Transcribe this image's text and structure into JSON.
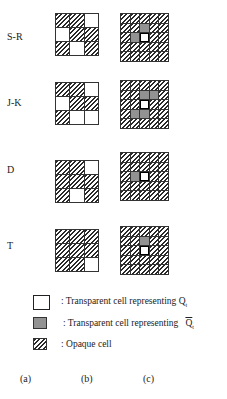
{
  "rows": [
    {
      "label": "S-R",
      "label_top": 31,
      "b_top": 13,
      "c_top": 13,
      "b": [
        "H",
        "H",
        "W",
        "W",
        "H",
        "H",
        "H",
        "W",
        "H"
      ],
      "c": [
        "H",
        "H",
        "H",
        "H",
        "H",
        "H",
        "H",
        "D",
        "H",
        "H",
        "H",
        "D",
        "Wb",
        "H",
        "H",
        "H",
        "H",
        "H",
        "H",
        "H",
        "H",
        "H",
        "H",
        "H",
        "H"
      ]
    },
    {
      "label": "J-K",
      "label_top": 97,
      "b_top": 82,
      "c_top": 80,
      "b": [
        "H",
        "H",
        "W",
        "W",
        "H",
        "H",
        "H",
        "W",
        "W"
      ],
      "c": [
        "H",
        "H",
        "H",
        "H",
        "H",
        "H",
        "H",
        "D",
        "D",
        "H",
        "H",
        "H",
        "Wb",
        "H",
        "H",
        "H",
        "D",
        "D",
        "H",
        "H",
        "H",
        "H",
        "H",
        "H",
        "H"
      ]
    },
    {
      "label": "D",
      "label_top": 164,
      "b_top": 160,
      "c_top": 152,
      "b": [
        "H",
        "H",
        "W",
        "H",
        "H",
        "H",
        "H",
        "W",
        "H"
      ],
      "c": [
        "H",
        "H",
        "H",
        "H",
        "H",
        "H",
        "H",
        "H",
        "H",
        "H",
        "H",
        "D",
        "Wb",
        "H",
        "H",
        "H",
        "H",
        "H",
        "H",
        "H",
        "H",
        "H",
        "H",
        "H",
        "H"
      ]
    },
    {
      "label": "T",
      "label_top": 240,
      "b_top": 229,
      "c_top": 226,
      "b": [
        "H",
        "H",
        "H",
        "H",
        "H",
        "H",
        "H",
        "H",
        "W"
      ],
      "c": [
        "H",
        "H",
        "H",
        "H",
        "H",
        "H",
        "H",
        "D",
        "H",
        "H",
        "H",
        "H",
        "Wb",
        "H",
        "H",
        "H",
        "H",
        "H",
        "H",
        "H",
        "H",
        "H",
        "H",
        "H",
        "H"
      ]
    }
  ],
  "legend": {
    "transparent_q": {
      "prefix": ": Transparent cell representing ",
      "symbol": "Q",
      "subscript": "t"
    },
    "transparent_qbar": {
      "prefix": ": Transparent cell representing ",
      "symbol": "Q",
      "subscript": "t"
    },
    "opaque": ": Opaque cell"
  },
  "column_labels": [
    "(a)",
    "(b)",
    "(c)"
  ]
}
